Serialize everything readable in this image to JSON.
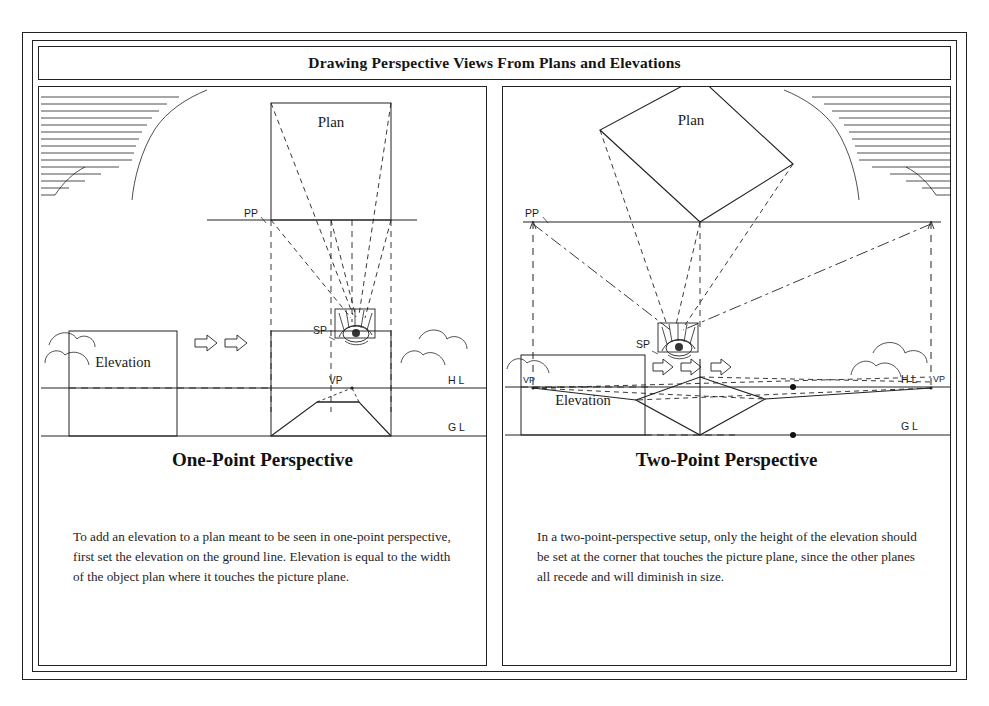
{
  "document": {
    "title": "Drawing Perspective Views From Plans and Elevations"
  },
  "panels": [
    {
      "id": "one-point",
      "heading": "One-Point Perspective",
      "caption": "To add an elevation to a plan meant to be seen in one-point perspective, first set the elevation on the ground line. Elevation is equal to the width of the object plan where it touches the picture plane.",
      "labels": {
        "plan": "Plan",
        "elevation": "Elevation",
        "picture_plane": "PP",
        "station_point": "SP",
        "vanishing_point": "VP",
        "horizon_line": "HL",
        "ground_line": "GL"
      }
    },
    {
      "id": "two-point",
      "heading": "Two-Point Perspective",
      "caption": "In a two-point-perspective setup, only the height of the elevation should be set at the corner that touches the picture plane, since the other planes all recede and will diminish in size.",
      "labels": {
        "plan": "Plan",
        "elevation": "Elevation",
        "picture_plane": "PP",
        "station_point": "SP",
        "vanishing_point_left": "VP",
        "vanishing_point_right": "VP",
        "horizon_line": "HL",
        "ground_line": "GL"
      }
    }
  ],
  "colors": {
    "ink": "#1a1a1a",
    "line": "#222222",
    "paper": "#ffffff"
  }
}
